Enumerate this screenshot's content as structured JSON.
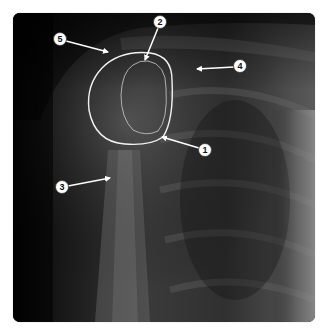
{
  "figure": {
    "type": "radiograph",
    "markers": [
      {
        "id": "1",
        "label": "1",
        "cx": 205,
        "cy": 150,
        "arrow_to": [
          162,
          137
        ]
      },
      {
        "id": "2",
        "label": "2",
        "cx": 160,
        "cy": 22,
        "arrow_to": [
          145,
          60
        ]
      },
      {
        "id": "3",
        "label": "3",
        "cx": 62,
        "cy": 187,
        "arrow_to": [
          110,
          178
        ]
      },
      {
        "id": "4",
        "label": "4",
        "cx": 240,
        "cy": 66,
        "arrow_to": [
          197,
          69
        ]
      },
      {
        "id": "5",
        "label": "5",
        "cx": 60,
        "cy": 40,
        "arrow_to": [
          108,
          52
        ]
      }
    ],
    "outlines": [
      {
        "name": "outer-outline",
        "color": "#f2f2f2"
      },
      {
        "name": "inner-outline",
        "color": "#bdbdbd"
      }
    ],
    "colors": {
      "background": "#ffffff",
      "annotation": "#ffffff",
      "marker_text": "#111111"
    }
  }
}
